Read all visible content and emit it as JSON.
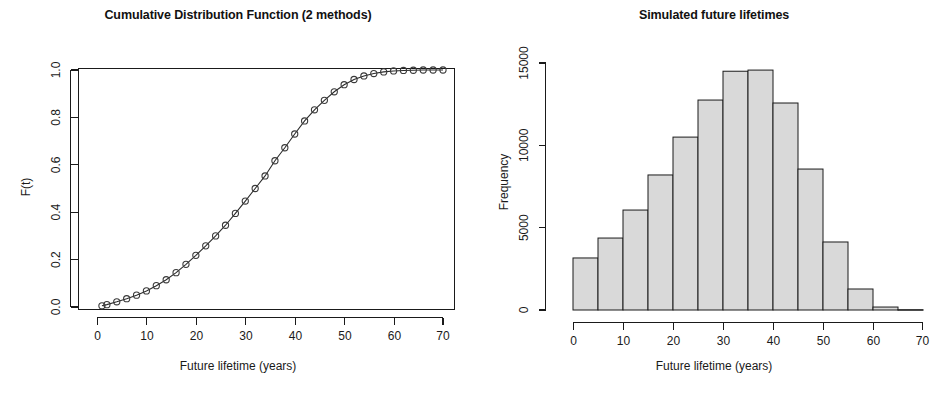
{
  "figure": {
    "panels": [
      {
        "id": "cdf",
        "title": "Cumulative Distribution Function (2 methods)",
        "xlabel": "Future lifetime (years)",
        "ylabel": "F(t)"
      },
      {
        "id": "histogram",
        "title": "Simulated future lifetimes",
        "xlabel": "Future lifetime (years)",
        "ylabel": "Frequency"
      }
    ]
  },
  "chart_data": [
    {
      "type": "line",
      "id": "cdf",
      "title": "Cumulative Distribution Function (2 methods)",
      "xlabel": "Future lifetime (years)",
      "ylabel": "F(t)",
      "xlim": [
        0,
        72
      ],
      "ylim": [
        0.0,
        1.02
      ],
      "xticks": [
        0,
        10,
        20,
        30,
        40,
        50,
        60,
        70
      ],
      "xticklabels": [
        "0",
        "10",
        "20",
        "30",
        "40",
        "50",
        "60",
        "70"
      ],
      "yticks": [
        0.0,
        0.2,
        0.4,
        0.6,
        0.8,
        1.0
      ],
      "yticklabels": [
        "0.0",
        "0.2",
        "0.4",
        "0.6",
        "0.8",
        "1.0"
      ],
      "grid": false,
      "legend": null,
      "marker": "open-circle",
      "series": [
        {
          "name": "F(t)",
          "x": [
            1,
            2,
            4,
            6,
            8,
            10,
            12,
            14,
            16,
            18,
            20,
            22,
            24,
            26,
            28,
            30,
            32,
            34,
            36,
            38,
            40,
            42,
            44,
            46,
            48,
            50,
            52,
            54,
            56,
            58,
            60,
            62,
            64,
            66,
            68,
            70
          ],
          "y": [
            0.005,
            0.01,
            0.022,
            0.035,
            0.05,
            0.068,
            0.09,
            0.115,
            0.145,
            0.18,
            0.218,
            0.258,
            0.3,
            0.345,
            0.395,
            0.447,
            0.5,
            0.553,
            0.617,
            0.672,
            0.73,
            0.785,
            0.832,
            0.872,
            0.908,
            0.938,
            0.96,
            0.975,
            0.985,
            0.992,
            0.996,
            0.998,
            0.999,
            1.0,
            1.0,
            1.0
          ]
        }
      ]
    },
    {
      "type": "bar",
      "id": "histogram",
      "title": "Simulated future lifetimes",
      "xlabel": "Future lifetime (years)",
      "ylabel": "Frequency",
      "xlim": [
        0,
        70
      ],
      "ylim": [
        0,
        15600
      ],
      "xticks": [
        0,
        10,
        20,
        30,
        40,
        50,
        60,
        70
      ],
      "xticklabels": [
        "0",
        "10",
        "20",
        "30",
        "40",
        "50",
        "60",
        "70"
      ],
      "yticks": [
        0,
        5000,
        10000,
        15000
      ],
      "yticklabels": [
        "0",
        "5000",
        "10000",
        "15000"
      ],
      "grid": false,
      "legend": null,
      "bin_width": 5,
      "bin_edges": [
        0,
        5,
        10,
        15,
        20,
        25,
        30,
        35,
        40,
        45,
        50,
        55,
        60,
        65,
        70
      ],
      "categories": [
        "0-5",
        "5-10",
        "10-15",
        "15-20",
        "20-25",
        "25-30",
        "30-35",
        "35-40",
        "40-45",
        "45-50",
        "50-55",
        "55-60",
        "60-65",
        "65-70"
      ],
      "values": [
        3160,
        4370,
        6070,
        8200,
        10500,
        12750,
        14500,
        14570,
        12570,
        8560,
        4130,
        1275,
        180,
        20
      ],
      "bar_fill": "#d9d9d9",
      "bar_stroke": "#1a1a1a"
    }
  ]
}
